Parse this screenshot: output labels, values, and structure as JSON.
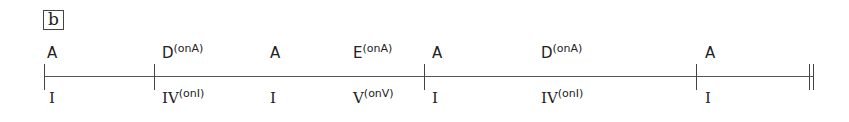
{
  "panel": {
    "label": "b"
  },
  "timeline": {
    "start_x": 44,
    "end_x": 813,
    "bar_lines_x": [
      44,
      154,
      424,
      696
    ],
    "final_double_bar_x": [
      809,
      813
    ]
  },
  "chords": [
    {
      "name": "A",
      "slash": "",
      "x": 47
    },
    {
      "name": "D",
      "slash": "(onA)",
      "x": 162
    },
    {
      "name": "A",
      "slash": "",
      "x": 270
    },
    {
      "name": "E",
      "slash": "(onA)",
      "x": 353
    },
    {
      "name": "A",
      "slash": "",
      "x": 432
    },
    {
      "name": "D",
      "slash": "(onA)",
      "x": 541
    },
    {
      "name": "A",
      "slash": "",
      "x": 705
    }
  ],
  "roman_numerals": [
    {
      "degree": "I",
      "slash": "",
      "x": 49
    },
    {
      "degree": "IV",
      "slash": "(onI)",
      "x": 162
    },
    {
      "degree": "I",
      "slash": "",
      "x": 270
    },
    {
      "degree": "V",
      "slash": "(onV)",
      "x": 353
    },
    {
      "degree": "I",
      "slash": "",
      "x": 432
    },
    {
      "degree": "IV",
      "slash": "(onI)",
      "x": 541
    },
    {
      "degree": "I",
      "slash": "",
      "x": 705
    }
  ]
}
